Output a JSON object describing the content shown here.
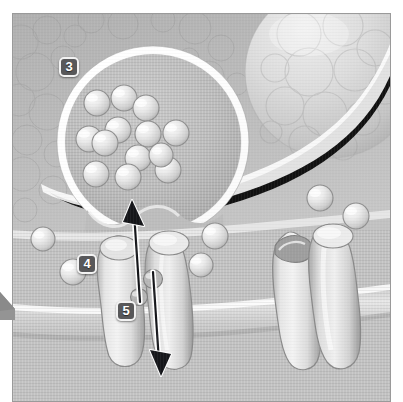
{
  "figure": {
    "kind": "scientific-illustration",
    "style": "grayscale-airbrush",
    "frame": {
      "x": 12,
      "y": 13,
      "width": 379,
      "height": 389,
      "border_color": "#9a9a9a"
    },
    "palette": {
      "background_gray": "#b9b9b9",
      "mid_gray": "#c3c3c3",
      "light_gray": "#d6d6d6",
      "highlight_white": "#f4f4f4",
      "shadow_gray": "#8d8d8d",
      "cleft_black": "#111111",
      "badge_fill": "#58585a",
      "badge_border": "#f2f2f2",
      "badge_text": "#ffffff",
      "arrow_black": "#15161a",
      "arrow_outline": "#ffffff",
      "page_white": "#ffffff"
    },
    "labels": [
      {
        "id": "badge-3",
        "text": "3",
        "x": 46,
        "y": 43,
        "points_to": "presynaptic-terminal-with-vesicles"
      },
      {
        "id": "badge-4",
        "text": "4",
        "x": 64,
        "y": 240,
        "points_to": "membrane-transporter-protein"
      },
      {
        "id": "badge-5",
        "text": "5",
        "x": 103,
        "y": 287,
        "points_to": "neurotransmitter-molecule-reuptake"
      }
    ],
    "elements": {
      "presynaptic_terminal": {
        "name": "presynaptic-terminal",
        "cx": 152,
        "cy": 140,
        "r": 92,
        "rim": "bright-white-ring",
        "vesicle_count": 13
      },
      "vesicles": [
        {
          "cx": 96,
          "cy": 102,
          "r": 12
        },
        {
          "cx": 123,
          "cy": 97,
          "r": 12
        },
        {
          "cx": 145,
          "cy": 107,
          "r": 12
        },
        {
          "cx": 117,
          "cy": 129,
          "r": 12
        },
        {
          "cx": 88,
          "cy": 138,
          "r": 12
        },
        {
          "cx": 104,
          "cy": 142,
          "r": 12
        },
        {
          "cx": 147,
          "cy": 133,
          "r": 12
        },
        {
          "cx": 175,
          "cy": 132,
          "r": 12
        },
        {
          "cx": 137,
          "cy": 157,
          "r": 12
        },
        {
          "cx": 95,
          "cy": 173,
          "r": 12
        },
        {
          "cx": 127,
          "cy": 176,
          "r": 12
        },
        {
          "cx": 167,
          "cy": 169,
          "r": 12
        },
        {
          "cx": 160,
          "cy": 162,
          "r": 11
        }
      ],
      "large_cell_top_right": {
        "cx": 330,
        "cy": 70,
        "r": 80,
        "texture": "clustered-bubbles"
      },
      "synaptic_cleft_band": {
        "description": "dark band sweeping from upper-right down across the figure"
      },
      "postsynaptic_membrane": {
        "description": "wide horizontal band across lower third"
      },
      "transporters": [
        {
          "id": "transporter-left",
          "x": 95,
          "y": 230,
          "w": 40,
          "h": 130,
          "state": "closed"
        },
        {
          "id": "transporter-mid",
          "x": 140,
          "y": 222,
          "w": 40,
          "h": 140,
          "state": "closed"
        },
        {
          "id": "transporter-right-open",
          "x": 268,
          "y": 218,
          "w": 40,
          "h": 140,
          "state": "open-cup"
        },
        {
          "id": "transporter-right",
          "x": 304,
          "y": 212,
          "w": 42,
          "h": 145,
          "state": "closed"
        }
      ],
      "free_molecules": [
        {
          "cx": 42,
          "cy": 238,
          "r": 11
        },
        {
          "cx": 72,
          "cy": 270,
          "r": 12
        },
        {
          "cx": 104,
          "cy": 247,
          "r": 12
        },
        {
          "cx": 214,
          "cy": 235,
          "r": 12
        },
        {
          "cx": 200,
          "cy": 264,
          "r": 11
        },
        {
          "cx": 148,
          "cy": 278,
          "r": 9
        },
        {
          "cx": 137,
          "cy": 296,
          "r": 8
        },
        {
          "cx": 319,
          "cy": 197,
          "r": 12
        },
        {
          "cx": 355,
          "cy": 215,
          "r": 12
        }
      ],
      "arrows": [
        {
          "id": "arrow-up",
          "x1": 139,
          "y1": 300,
          "x2": 131,
          "y2": 203,
          "direction": "up",
          "meaning": "release"
        },
        {
          "id": "arrow-down",
          "x1": 153,
          "y1": 270,
          "x2": 153,
          "y2": 373,
          "direction": "down",
          "meaning": "reuptake"
        }
      ],
      "corner_tab": {
        "x": 0,
        "y": 287,
        "w": 15,
        "h": 33,
        "fill": "#8f8f8f"
      }
    }
  }
}
